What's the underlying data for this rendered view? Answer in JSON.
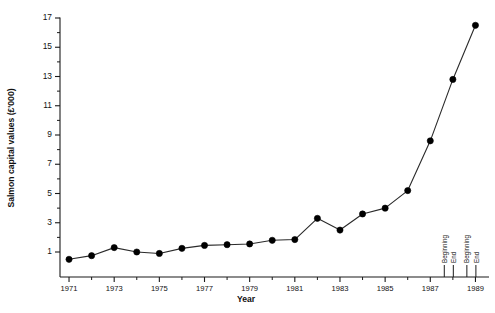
{
  "chart_data": {
    "type": "line",
    "title": "",
    "xlabel": "Year",
    "ylabel": "Salmon capital values (£'000)",
    "xlim": [
      1970.6,
      1989.6
    ],
    "ylim": [
      0,
      17.6
    ],
    "grid": false,
    "legend": null,
    "y_ticks_major": [
      1,
      3,
      5,
      7,
      9,
      11,
      13,
      15,
      17
    ],
    "y_ticks_minor": [
      2,
      4,
      6,
      8,
      10,
      12,
      14,
      16
    ],
    "x_ticks_major": [
      1971,
      1973,
      1975,
      1977,
      1979,
      1981,
      1983,
      1985,
      1987,
      1989
    ],
    "x_ticks_minor": [
      1972,
      1974,
      1976,
      1978,
      1980,
      1982,
      1984,
      1986,
      1988
    ],
    "x": [
      1971,
      1972,
      1973,
      1974,
      1975,
      1976,
      1977,
      1978,
      1979,
      1980,
      1981,
      1982,
      1983,
      1984,
      1985,
      1986,
      1987,
      1988,
      1989
    ],
    "values": [
      0.5,
      0.75,
      1.3,
      1.0,
      0.9,
      1.25,
      1.45,
      1.5,
      1.55,
      1.8,
      1.85,
      3.3,
      2.5,
      3.6,
      4.0,
      5.2,
      8.6,
      12.8,
      16.5
    ],
    "series": [
      {
        "name": "Salmon capital values",
        "values": [
          0.5,
          0.75,
          1.3,
          1.0,
          0.9,
          1.25,
          1.45,
          1.5,
          1.55,
          1.8,
          1.85,
          3.3,
          2.5,
          3.6,
          4.0,
          5.2,
          8.6,
          12.8,
          16.5
        ]
      }
    ],
    "annotations": [
      {
        "label": "Beginning",
        "x": 1987.62
      },
      {
        "label": "End",
        "x": 1988.02
      },
      {
        "label": "Beginning",
        "x": 1988.62
      },
      {
        "label": "End",
        "x": 1989.02
      }
    ],
    "marker_color": "#000000",
    "line_color": "#2a2a2a",
    "background_color": "#ffffff"
  }
}
